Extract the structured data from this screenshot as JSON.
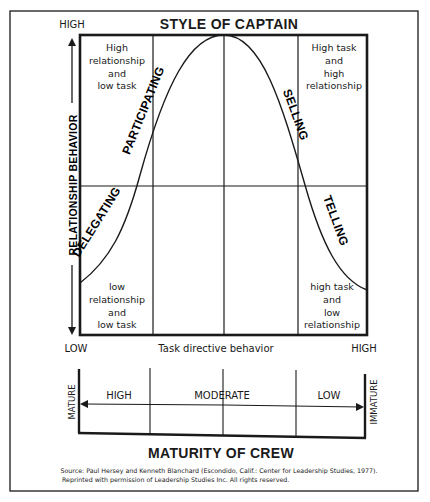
{
  "title": "STYLE OF CAPTAIN",
  "y_axis": {
    "label": "RELATIONSHIP BEHAVIOR",
    "high": "HIGH",
    "low": "LOW"
  },
  "x_axis": {
    "label": "Task directive behavior",
    "low": "LOW",
    "high": "HIGH"
  },
  "quadrants": {
    "top_left": [
      "High",
      "relationship",
      "and",
      "low task"
    ],
    "top_right": [
      "High task",
      "and",
      "high",
      "relationship"
    ],
    "bottom_left": [
      "low",
      "relationship",
      "and",
      "low task"
    ],
    "bottom_right": [
      "high task",
      "and",
      "low",
      "relationship"
    ]
  },
  "styles": {
    "participating": "PARTICIPATING",
    "selling": "SELLING",
    "delegating": "DELEGATING",
    "telling": "TELLING"
  },
  "maturity": {
    "title": "MATURITY OF CREW",
    "left_end": "MATURE",
    "right_end": "IMMATURE",
    "levels": [
      "HIGH",
      "MODERATE",
      "LOW"
    ]
  },
  "source": {
    "line1": "Source: Paul Hersey and Kenneth Blanchard (Escondido, Calif.: Center for Leadership Studies, 1977).",
    "line2": "Reprinted with permission of Leadership Studies Inc. All rights reserved."
  },
  "colors": {
    "ink": "#1a1a1a",
    "paper": "#ffffff"
  }
}
